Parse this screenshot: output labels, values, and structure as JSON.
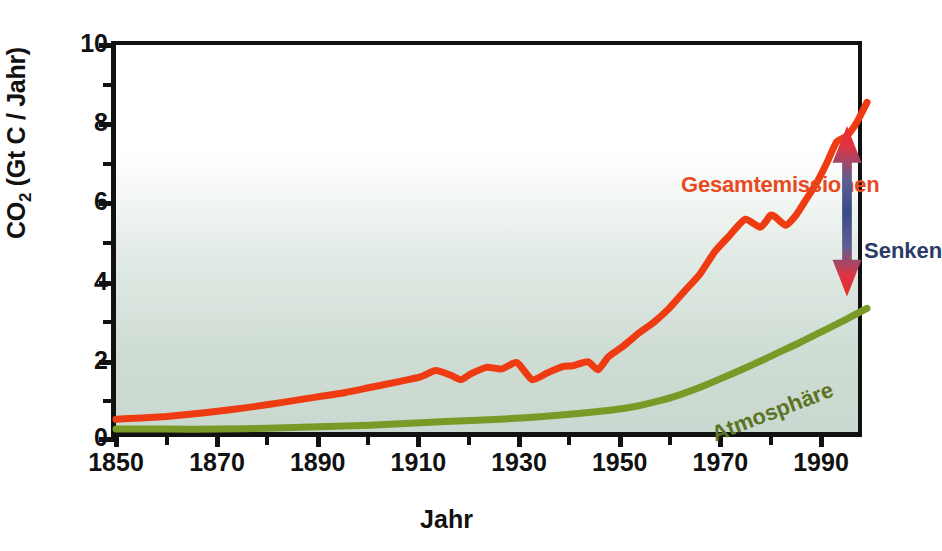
{
  "chart_data": {
    "type": "line",
    "title": "",
    "xlabel": "Jahr",
    "ylabel": "CO2 (Gt C / Jahr)",
    "ylabel_base": "CO",
    "ylabel_sub": "2",
    "ylabel_rest": " (Gt C / Jahr)",
    "xlim": [
      1850,
      1998
    ],
    "ylim": [
      0,
      10
    ],
    "grid": false,
    "legend_position": "inline-annotations",
    "xticks": [
      1850,
      1870,
      1890,
      1910,
      1930,
      1950,
      1970,
      1990
    ],
    "xtick_labels": [
      "1850",
      "1870",
      "1890",
      "1910",
      "1930",
      "1950",
      "1970",
      "1990"
    ],
    "xminor_interval": 10,
    "yticks": [
      0,
      2,
      4,
      6,
      8,
      10
    ],
    "ytick_labels": [
      "0",
      "2",
      "4",
      "6",
      "8",
      "10"
    ],
    "yminor_interval": 1,
    "colors": {
      "total_emissions": "#ef3b12",
      "atmosphere": "#7a9a28",
      "senken_label": "#2c3a68",
      "arrow_top": "#e8282c",
      "arrow_middle": "#3b4a86",
      "arrow_bottom": "#e8282c",
      "plot_background_top": "#ffffff",
      "plot_background_bottom": "#c9d8d0",
      "axis": "#111111"
    },
    "series": [
      {
        "name": "Gesamtemissionen",
        "color": "#ef3b12",
        "label_text": "Gesamtemissionen",
        "x": [
          1850,
          1855,
          1860,
          1865,
          1870,
          1875,
          1880,
          1885,
          1890,
          1895,
          1900,
          1905,
          1910,
          1913,
          1916,
          1918,
          1920,
          1923,
          1926,
          1929,
          1932,
          1935,
          1938,
          1940,
          1943,
          1945,
          1947,
          1950,
          1953,
          1956,
          1959,
          1962,
          1965,
          1968,
          1971,
          1974,
          1977,
          1979,
          1980,
          1982,
          1984,
          1986,
          1988,
          1990,
          1992,
          1994,
          1996,
          1998
        ],
        "values": [
          0.55,
          0.58,
          0.62,
          0.68,
          0.75,
          0.83,
          0.92,
          1.02,
          1.12,
          1.22,
          1.35,
          1.48,
          1.62,
          1.78,
          1.66,
          1.55,
          1.7,
          1.86,
          1.82,
          1.98,
          1.55,
          1.72,
          1.88,
          1.9,
          2.0,
          1.8,
          2.12,
          2.4,
          2.72,
          3.0,
          3.35,
          3.78,
          4.2,
          4.78,
          5.2,
          5.6,
          5.4,
          5.7,
          5.65,
          5.45,
          5.7,
          6.1,
          6.5,
          7.0,
          7.55,
          7.7,
          8.05,
          8.55
        ]
      },
      {
        "name": "Atmosphäre",
        "color": "#7a9a28",
        "label_text": "Atmosphäre",
        "x": [
          1850,
          1860,
          1870,
          1880,
          1890,
          1900,
          1910,
          1920,
          1930,
          1940,
          1950,
          1955,
          1960,
          1965,
          1970,
          1975,
          1980,
          1985,
          1990,
          1994,
          1998
        ],
        "values": [
          0.3,
          0.3,
          0.3,
          0.32,
          0.36,
          0.4,
          0.46,
          0.52,
          0.58,
          0.68,
          0.82,
          0.95,
          1.12,
          1.35,
          1.62,
          1.9,
          2.2,
          2.5,
          2.82,
          3.08,
          3.35
        ]
      }
    ],
    "annotations": [
      {
        "name": "gesamtemissionen-label",
        "text": "Gesamtemissionen",
        "color": "#e8491f"
      },
      {
        "name": "senken-label",
        "text": "Senken",
        "color": "#2c3a68"
      },
      {
        "name": "atmosphaere-label",
        "text": "Atmosphäre",
        "color": "#5c7324"
      },
      {
        "name": "senken-arrow",
        "text": "",
        "type": "double-headed-arrow",
        "from_value": 7.8,
        "to_value": 3.8,
        "at_year": 1994
      }
    ]
  }
}
